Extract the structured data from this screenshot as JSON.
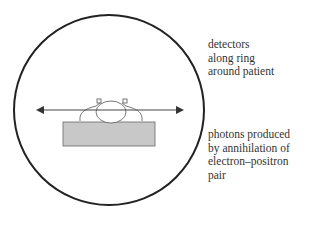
{
  "diagram": {
    "type": "PET scanner cross-section",
    "labels": {
      "detectors": "detectors\nalong ring\naround patient",
      "photons": "photons produced\nby annihilation of\nelectron–positron\npair"
    },
    "colors": {
      "ring": "#222222",
      "table": "#c8c8c8",
      "line": "#444444",
      "text": "#333333"
    }
  }
}
